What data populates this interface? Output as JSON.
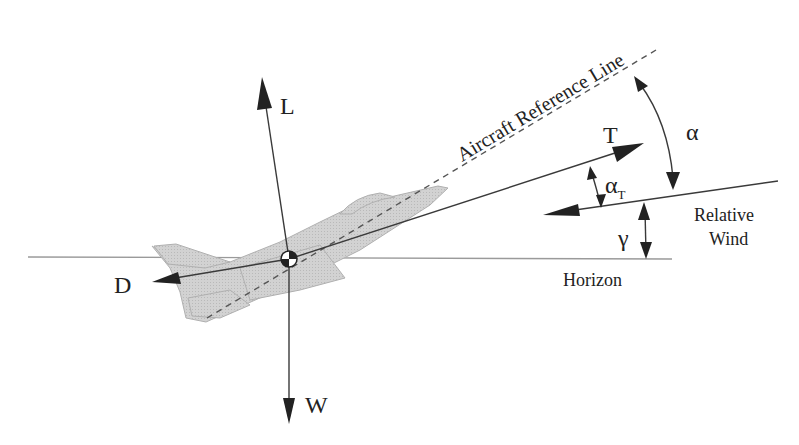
{
  "diagram": {
    "labels": {
      "lift": "L",
      "weight": "W",
      "drag": "D",
      "thrust": "T",
      "reference_line": "Aircraft Reference Line",
      "alpha": "α",
      "alpha_t_main": "α",
      "alpha_t_sub": "T",
      "gamma": "γ",
      "relative_wind_1": "Relative",
      "relative_wind_2": "Wind",
      "horizon": "Horizon"
    },
    "colors": {
      "line": "#3a3a3a",
      "aircraft_fill": "#c9c9c9",
      "aircraft_stroke": "#a8a8a8",
      "horizon": "#9a9a9a",
      "background": "#ffffff"
    }
  }
}
